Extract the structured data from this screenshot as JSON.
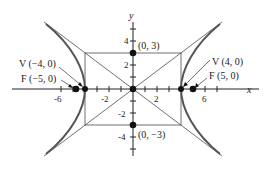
{
  "diagram": {
    "type": "hyperbola",
    "equation_params": {
      "a": 4,
      "b": 3,
      "c": 5
    },
    "axes": {
      "x_label": "x",
      "y_label": "y",
      "x_ticks": [
        "-6",
        "-2",
        "2",
        "6"
      ],
      "y_ticks": [
        "4",
        "2",
        "-2",
        "-4"
      ]
    },
    "points": {
      "vertex_left": {
        "label": "V (−4, 0)",
        "x": -4,
        "y": 0
      },
      "focus_left": {
        "label": "F (−5, 0)",
        "x": -5,
        "y": 0
      },
      "vertex_right": {
        "label": "V (4, 0)",
        "x": 4,
        "y": 0
      },
      "focus_right": {
        "label": "F (5, 0)",
        "x": 5,
        "y": 0
      },
      "co_vertex_top": {
        "label": "(0, 3)",
        "x": 0,
        "y": 3
      },
      "co_vertex_bottom": {
        "label": "(0, −3)",
        "x": 0,
        "y": -3
      },
      "origin": {
        "x": 0,
        "y": 0
      }
    },
    "colors": {
      "curve": "#555555",
      "lines": "#333333",
      "points": "#111111"
    }
  }
}
